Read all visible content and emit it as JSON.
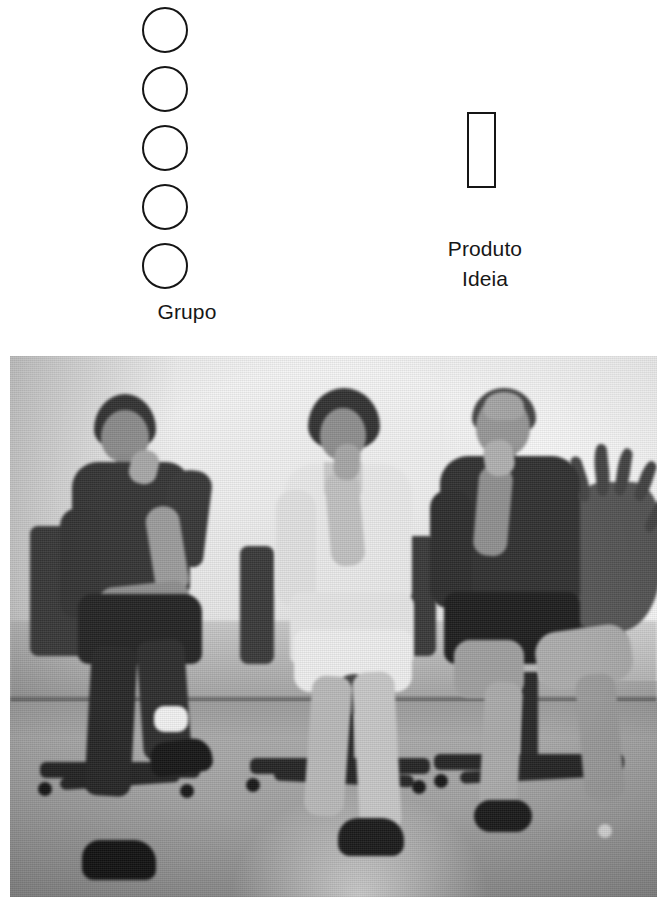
{
  "page": {
    "background_color": "#ffffff",
    "width": 669,
    "height": 919
  },
  "diagram": {
    "stroke_color": "#151515",
    "text_color": "#171717",
    "group_node": {
      "shape": "circle",
      "count": 5,
      "label": "Grupo",
      "items": [
        {
          "index": 1,
          "shape": "circle"
        },
        {
          "index": 2,
          "shape": "circle"
        },
        {
          "index": 3,
          "shape": "circle"
        },
        {
          "index": 4,
          "shape": "circle"
        },
        {
          "index": 5,
          "shape": "circle"
        }
      ]
    },
    "product_node": {
      "shape": "rectangle",
      "label_line_1": "Produto",
      "label_line_2": "Ideia"
    }
  },
  "photo": {
    "type": "grayscale-photograph",
    "description": "Three people seated on office chairs in front of a light wall",
    "people": [
      {
        "position": "left",
        "clothing": "dark short-sleeve shirt",
        "pose": "hand on chin, legs crossed"
      },
      {
        "position": "center",
        "clothing": "white top and light skirt",
        "pose": "hands clasped near chin"
      },
      {
        "position": "right",
        "clothing": "dark short-sleeve shirt",
        "pose": "hand near mouth, legs crossed"
      }
    ],
    "objects": [
      {
        "name": "office-chair",
        "count": 3
      },
      {
        "name": "potted-plant",
        "count": 1,
        "position": "right edge"
      },
      {
        "name": "wall",
        "tone": "light gray"
      },
      {
        "name": "floor",
        "tone": "mid gray"
      }
    ]
  }
}
